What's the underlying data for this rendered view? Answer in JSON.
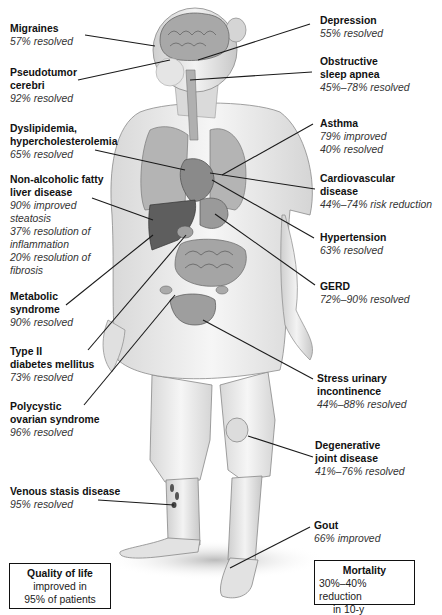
{
  "diagram": {
    "callouts": [
      {
        "id": "migraines",
        "title_lines": [
          "Migraines"
        ],
        "detail_lines": [
          "57% resolved"
        ]
      },
      {
        "id": "pseudotumor",
        "title_lines": [
          "Pseudotumor",
          "cerebri"
        ],
        "detail_lines": [
          "92% resolved"
        ]
      },
      {
        "id": "dyslipidemia",
        "title_lines": [
          "Dyslipidemia,",
          "hypercholesterolemia"
        ],
        "detail_lines": [
          "65%  resolved"
        ]
      },
      {
        "id": "nafld",
        "title_lines": [
          "Non-alcoholic fatty",
          "liver disease"
        ],
        "detail_lines": [
          "90%  improved",
          "steatosis",
          "37% resolution of",
          "inflammation",
          "20% resolution of",
          "fibrosis"
        ]
      },
      {
        "id": "metabolic",
        "title_lines": [
          "Metabolic",
          "syndrome"
        ],
        "detail_lines": [
          "90% resolved"
        ]
      },
      {
        "id": "diabetes",
        "title_lines": [
          "Type II",
          "diabetes mellitus"
        ],
        "detail_lines": [
          "73% resolved"
        ]
      },
      {
        "id": "pcos",
        "title_lines": [
          "Polycystic",
          "ovarian syndrome"
        ],
        "detail_lines": [
          "96% resolved"
        ]
      },
      {
        "id": "venous",
        "title_lines": [
          "Venous stasis disease"
        ],
        "detail_lines": [
          "95% resolved"
        ]
      },
      {
        "id": "depression",
        "title_lines": [
          "Depression"
        ],
        "detail_lines": [
          "55% resolved"
        ]
      },
      {
        "id": "osa",
        "title_lines": [
          "Obstructive",
          "sleep apnea"
        ],
        "detail_lines": [
          "45%–78% resolved"
        ]
      },
      {
        "id": "asthma",
        "title_lines": [
          "Asthma"
        ],
        "detail_lines": [
          "79% improved",
          "40% resolved"
        ]
      },
      {
        "id": "cvd",
        "title_lines": [
          "Cardiovascular",
          "disease"
        ],
        "detail_lines": [
          "44%–74% risk reduction"
        ]
      },
      {
        "id": "hypertension",
        "title_lines": [
          "Hypertension"
        ],
        "detail_lines": [
          "63% resolved"
        ]
      },
      {
        "id": "gerd",
        "title_lines": [
          "GERD"
        ],
        "detail_lines": [
          "72%–90% resolved"
        ]
      },
      {
        "id": "sui",
        "title_lines": [
          "Stress urinary",
          "incontinence"
        ],
        "detail_lines": [
          "44%–88% resolved"
        ]
      },
      {
        "id": "djd",
        "title_lines": [
          "Degenerative",
          "joint disease"
        ],
        "detail_lines": [
          "41%–76% resolved"
        ]
      },
      {
        "id": "gout",
        "title_lines": [
          "Gout"
        ],
        "detail_lines": [
          "66% improved"
        ]
      }
    ],
    "boxes": {
      "quality_of_life": {
        "title": "Quality of life",
        "detail_lines": [
          "improved in",
          "95% of patients"
        ]
      },
      "mortality": {
        "title": "Mortality",
        "detail_lines": [
          "30%–40% reduction",
          "in 10-y"
        ]
      }
    },
    "colors": {
      "text": "#111111",
      "detail_text": "#333333",
      "leader_line": "#1a1a1a",
      "skin": "#e6e6e6",
      "organ": "#9a9a9a",
      "dark_organ": "#5e5e5e"
    }
  }
}
